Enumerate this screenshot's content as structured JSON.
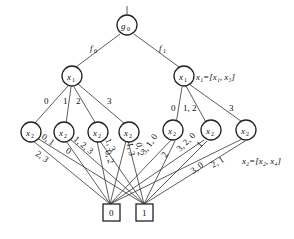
{
  "diagram": {
    "root": {
      "label": "g",
      "sub": "0"
    },
    "branch_labels": [
      {
        "label": "f",
        "sub": "0"
      },
      {
        "label": "f",
        "sub": "1"
      }
    ],
    "level1": [
      {
        "label": "x",
        "sub": "1"
      },
      {
        "label": "x",
        "sub": "1",
        "annotation": "x₁=[x₁, x₃]"
      }
    ],
    "level1_edge_labels": {
      "left": [
        "0",
        "1",
        "2",
        "3"
      ],
      "right": [
        "0",
        "1, 2",
        "3"
      ]
    },
    "level2": [
      {
        "label": "x",
        "sub": "2",
        "edge_labels": [
          "0, 1",
          "2, 3"
        ]
      },
      {
        "label": "x",
        "sub": "2",
        "edge_labels": [
          "0",
          "1, 2, 3"
        ]
      },
      {
        "label": "x",
        "sub": "2",
        "edge_labels": [
          "1, 3",
          "0, 2"
        ]
      },
      {
        "label": "x",
        "sub": "2",
        "edge_labels": [
          "1, 3",
          "0, 2"
        ]
      },
      {
        "label": "x",
        "sub": "2",
        "edge_labels": [
          "3, 1, 0",
          "2"
        ]
      },
      {
        "label": "x",
        "sub": "2",
        "edge_labels": [
          "3, 2, 0",
          "1"
        ]
      },
      {
        "label": "x",
        "sub": "2",
        "edge_labels": [
          "3, 0",
          "2, 1"
        ],
        "annotation": "x₂=[x₂, x₄]"
      }
    ],
    "terminals": [
      "0",
      "1"
    ]
  }
}
